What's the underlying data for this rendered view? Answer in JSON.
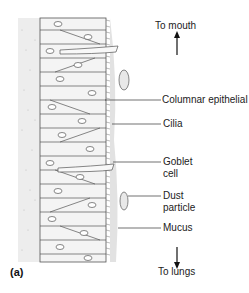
{
  "figure": {
    "panel_label": "(a)",
    "direction_top": "To mouth",
    "direction_bottom": "To lungs",
    "labels": [
      {
        "id": "columnar",
        "text": "Columnar epithelial cell"
      },
      {
        "id": "cilia",
        "text": "Cilia"
      },
      {
        "id": "goblet_1",
        "text": "Goblet"
      },
      {
        "id": "goblet_2",
        "text": "cell"
      },
      {
        "id": "dust_1",
        "text": "Dust"
      },
      {
        "id": "dust_2",
        "text": "particle"
      },
      {
        "id": "mucus",
        "text": "Mucus"
      }
    ]
  }
}
